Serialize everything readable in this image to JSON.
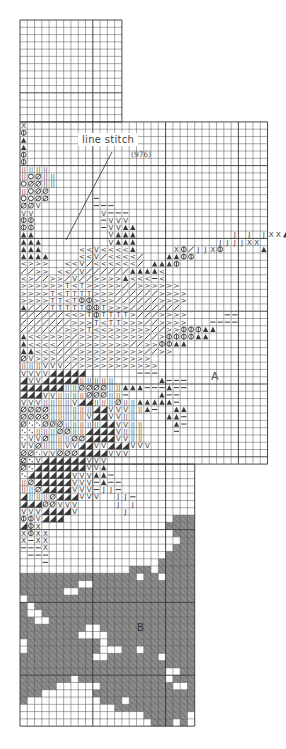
{
  "diagram": {
    "type": "cross-stitch-chart",
    "grid": {
      "origin_x": 20,
      "origin_y": 20,
      "cell": 7.28,
      "line_color": "#555555",
      "major_line_color": "#333333",
      "major_every": 10,
      "sections": [
        {
          "name": "top-narrow",
          "col_start": 0,
          "col_end": 14,
          "row_start": 0,
          "row_end": 14
        },
        {
          "name": "middle-wide",
          "col_start": 0,
          "col_end": 34,
          "row_start": 14,
          "row_end": 61
        },
        {
          "name": "bottom-narrow",
          "col_start": 0,
          "col_end": 24,
          "row_start": 61,
          "row_end": 97
        }
      ]
    },
    "callout": {
      "title": "line stitch",
      "code": "(976)",
      "leader_from": [
        112,
        152
      ],
      "leader_to": [
        66,
        240
      ]
    },
    "region_labels": {
      "a": "A",
      "b": "B"
    },
    "fill_color": "#8a8a8a",
    "symbol_color": "#3a3a3a",
    "legend_symbols": [
      "X",
      "Φ",
      "▲",
      "◎",
      "II",
      "O",
      "Ø",
      "V",
      "—",
      "J",
      "<",
      ">",
      "/",
      "T",
      "◢",
      "·"
    ],
    "symbol_rows": [
      {
        "row": 14,
        "col": 0,
        "cells": "X"
      },
      {
        "row": 15,
        "col": 0,
        "cells": "Φ"
      },
      {
        "row": 16,
        "col": 0,
        "cells": "▲"
      },
      {
        "row": 17,
        "col": 0,
        "cells": "▲"
      },
      {
        "row": 18,
        "col": 0,
        "cells": "Φ"
      },
      {
        "row": 19,
        "col": 0,
        "cells": "Φ"
      },
      {
        "row": 20,
        "col": 0,
        "cells": "IIII"
      },
      {
        "row": 21,
        "col": 0,
        "cells": "IOØII"
      },
      {
        "row": 22,
        "col": 0,
        "cells": "OØØII"
      },
      {
        "row": 23,
        "col": 0,
        "cells": "IOØØ"
      },
      {
        "row": 24,
        "col": 0,
        "cells": "OOØØ......—"
      },
      {
        "row": 25,
        "col": 0,
        "cells": "ØØV.......———"
      },
      {
        "row": 26,
        "col": 0,
        "cells": "VV.........V———"
      },
      {
        "row": 27,
        "col": 0,
        "cells": "ΦΦ.........—VVV"
      },
      {
        "row": 28,
        "col": 0,
        "cells": "ΦΦ.........—VV▲▲"
      },
      {
        "row": 29,
        "col": 0,
        "cells": "▲▲..........V▲▲▲.............J.J.JXX▲▲"
      },
      {
        "row": 30,
        "col": 0,
        "cells": "▲▲▲.........V▲▲▲...........JJJJXX....▲▲"
      },
      {
        "row": 31,
        "col": 0,
        "cells": "▲▲▲.....<<V<<<<▲.....XΦ/JJXΦ.....▲"
      },
      {
        "row": 32,
        "col": 0,
        "cells": "▲▲▲▲....<<V/<<<</...▲▲ΦΦ"
      },
      {
        "row": 33,
        "col": 0,
        "cells": "<>>>..<<V/<<<<<</.▲▲▲Φ"
      },
      {
        "row": 34,
        "col": 0,
        "cells": "//>>.<</V//////▲▲▲▲<"
      },
      {
        "row": 35,
        "col": 0,
        "cells": "<>//>>/V//>>>>▲<<<—<"
      },
      {
        "row": 36,
        "col": 0,
        "cells": ">>>>>>T<T>>>>>//>>>>>>"
      },
      {
        "row": 37,
        "col": 0,
        "cells": ">>>>T<TTTT>>>//////>>>>"
      },
      {
        "row": 38,
        "col": 0,
        "cells": ">>>>TT<TΦΦ>>>//////>>>>"
      },
      {
        "row": 39,
        "col": 0,
        "cells": "▲///TTTTTΦΦT>>>///////"
      },
      {
        "row": 40,
        "col": 0,
        "cells": "//////<<>TΦTTTT>///>>>>.....——"
      },
      {
        "row": 41,
        "col": 0,
        "cells": "///////>>>T<TT>>>//>>>>...————"
      },
      {
        "row": 42,
        "col": 0,
        "cells": "//////>>>T<<>>>>>>//>>ΦΦΦ▲▲"
      },
      {
        "row": 43,
        "col": 0,
        "cells": "▲<<>>>>/>>>><>>>>//>ΦΦΦΦ▲▲"
      },
      {
        "row": 44,
        "col": 0,
        "cells": "▲<<<<///>>>>>>>//>>ΦΦ▲▲"
      },
      {
        "row": 45,
        "col": 0,
        "cells": "▲▲<<<///>>>>>>>>>//>>"
      },
      {
        "row": 46,
        "col": 0,
        "cells": "ØV>>>//>>>>>>>>>>>"
      },
      {
        "row": 47,
        "col": 0,
        "cells": "IIIVVV//>>>>>>>>>>>"
      },
      {
        "row": 48,
        "col": 0,
        "cells": "VVVV◢◢◢◢◢.......———"
      },
      {
        "row": 49,
        "col": 0,
        "cells": "◢VV◢◢◢◢◢IIIII......▲———"
      },
      {
        "row": 50,
        "col": 0,
        "cells": "◢◢◢◢◢◢IIØØØØII▲▲▲———▲——"
      },
      {
        "row": 51,
        "col": 0,
        "cells": "◢◢◢VVIIIIØØØII—....▲——"
      },
      {
        "row": 52,
        "col": 0,
        "cells": "VVVIIIIV◢◢IIIØII▲▲▲▲▲—"
      },
      {
        "row": 53,
        "col": 0,
        "cells": "ØØØØIIIIII◢◢VVVII▲—..▲▲"
      },
      {
        "row": 54,
        "col": 0,
        "cells": "ØØØØIIIIIV◢◢VVII....▲▲—"
      },
      {
        "row": 55,
        "col": 0,
        "cells": "Ø··ØØØIIIII◢◢VVII....▲—"
      },
      {
        "row": 56,
        "col": 0,
        "cells": "··IIIØØII◢◢◢◢VIII....—"
      },
      {
        "row": 57,
        "col": 0,
        "cells": "·VVØIIIØØ◢◢◢◢VVII"
      },
      {
        "row": 58,
        "col": 0,
        "cells": "VVØIIIVV◢◢VV◢◢◢VVV"
      },
      {
        "row": 59,
        "col": 0,
        "cells": "ØØ·VVØØØ◢◢◢◢VVV"
      },
      {
        "row": 60,
        "col": 0,
        "cells": "Ø·V◢◢◢◢◢◢VVV"
      },
      {
        "row": 61,
        "col": 0,
        "cells": "Ø·◢◢◢◢◢◢◢VV▲"
      },
      {
        "row": 62,
        "col": 0,
        "cells": "·◢◢◢◢◢◢VVV▲▲—"
      },
      {
        "row": 63,
        "col": 0,
        "cells": "IØ◢◢◢◢◢VVV—▲——"
      },
      {
        "row": 64,
        "col": 0,
        "cells": "IIØ◢◢◢◢VVV—JJ—"
      },
      {
        "row": 65,
        "col": 0,
        "cells": "◢IIIØ◢◢◢VVV..JJ—"
      },
      {
        "row": 66,
        "col": 0,
        "cells": "◢◢◢ØØVVV.....J.J"
      },
      {
        "row": 67,
        "col": 0,
        "cells": "VVV◢◢◢◢V......J"
      },
      {
        "row": 68,
        "col": 0,
        "cells": "ΦΦV◢◢◢"
      },
      {
        "row": 69,
        "col": 0,
        "cells": "◢ΦX"
      },
      {
        "row": 70,
        "col": 0,
        "cells": "XΦXX"
      },
      {
        "row": 71,
        "col": 0,
        "cells": "X—XX"
      },
      {
        "row": 72,
        "col": 0,
        "cells": "———X"
      },
      {
        "row": 73,
        "col": 0,
        "cells": ".———"
      },
      {
        "row": 74,
        "col": 0,
        "cells": "...—"
      }
    ],
    "fill_rows": [
      {
        "row": 68,
        "ranges": [
          [
            21,
            24
          ]
        ]
      },
      {
        "row": 69,
        "ranges": [
          [
            20,
            24
          ]
        ]
      },
      {
        "row": 70,
        "ranges": [
          [
            21,
            24
          ]
        ]
      },
      {
        "row": 71,
        "ranges": [
          [
            22,
            24
          ]
        ]
      },
      {
        "row": 72,
        "ranges": [
          [
            21,
            24
          ]
        ]
      },
      {
        "row": 73,
        "ranges": [
          [
            20,
            24
          ]
        ]
      },
      {
        "row": 74,
        "ranges": [
          [
            19,
            24
          ]
        ]
      },
      {
        "row": 75,
        "ranges": [
          [
            15,
            18
          ],
          [
            19,
            24
          ]
        ]
      },
      {
        "row": 76,
        "ranges": [
          [
            0,
            16
          ],
          [
            17,
            19
          ],
          [
            20,
            24
          ]
        ]
      },
      {
        "row": 77,
        "ranges": [
          [
            0,
            8
          ],
          [
            10,
            24
          ]
        ]
      },
      {
        "row": 78,
        "ranges": [
          [
            0,
            6
          ],
          [
            8,
            24
          ]
        ]
      },
      {
        "row": 79,
        "ranges": [
          [
            1,
            24
          ]
        ]
      },
      {
        "row": 80,
        "ranges": [
          [
            0,
            1
          ],
          [
            2,
            24
          ]
        ]
      },
      {
        "row": 81,
        "ranges": [
          [
            0,
            1
          ],
          [
            3,
            24
          ]
        ]
      },
      {
        "row": 82,
        "ranges": [
          [
            0,
            2
          ],
          [
            4,
            24
          ]
        ]
      },
      {
        "row": 83,
        "ranges": [
          [
            0,
            9
          ],
          [
            11,
            24
          ]
        ]
      },
      {
        "row": 84,
        "ranges": [
          [
            0,
            8
          ],
          [
            12,
            24
          ]
        ]
      },
      {
        "row": 85,
        "ranges": [
          [
            1,
            11
          ],
          [
            12,
            24
          ]
        ]
      },
      {
        "row": 86,
        "ranges": [
          [
            1,
            11
          ],
          [
            14,
            16
          ],
          [
            17,
            24
          ]
        ]
      },
      {
        "row": 87,
        "ranges": [
          [
            0,
            10
          ],
          [
            12,
            19
          ],
          [
            20,
            24
          ]
        ]
      },
      {
        "row": 88,
        "ranges": [
          [
            0,
            24
          ]
        ]
      },
      {
        "row": 89,
        "ranges": [
          [
            0,
            20
          ],
          [
            22,
            24
          ]
        ]
      },
      {
        "row": 90,
        "ranges": [
          [
            0,
            7
          ],
          [
            8,
            20
          ],
          [
            21,
            24
          ]
        ]
      },
      {
        "row": 91,
        "ranges": [
          [
            0,
            5
          ],
          [
            11,
            21
          ],
          [
            23,
            24
          ]
        ]
      },
      {
        "row": 92,
        "ranges": [
          [
            0,
            3
          ],
          [
            10,
            24
          ]
        ]
      },
      {
        "row": 93,
        "ranges": [
          [
            0,
            1
          ],
          [
            11,
            14
          ],
          [
            15,
            24
          ]
        ]
      },
      {
        "row": 94,
        "ranges": [
          [
            13,
            24
          ]
        ]
      },
      {
        "row": 95,
        "ranges": [
          [
            17,
            23
          ]
        ]
      },
      {
        "row": 96,
        "ranges": [
          [
            18,
            21
          ],
          [
            22,
            23
          ]
        ]
      },
      {
        "row": 97,
        "ranges": []
      }
    ]
  }
}
